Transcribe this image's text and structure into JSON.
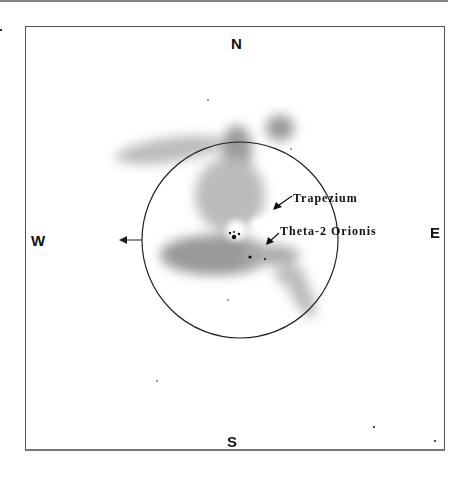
{
  "compass": {
    "north": "N",
    "south": "S",
    "east": "E",
    "west": "W"
  },
  "labels": {
    "trapezium": "Trapezium",
    "theta2": "Theta-2",
    "orionis": "Orionis"
  },
  "field_circle": {
    "cx": 240,
    "cy": 240,
    "r": 98
  },
  "colors": {
    "nebula": "#777777",
    "ink": "#111111",
    "frame": "#555555"
  }
}
